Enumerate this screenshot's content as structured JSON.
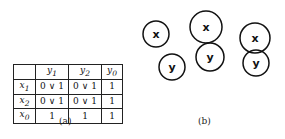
{
  "panel_a": {
    "caption": "(a)",
    "table": {
      "header": [
        "",
        "y1",
        "y2",
        "y0"
      ],
      "rows": [
        {
          "label": "x1",
          "cells": [
            "0 ∨ 1",
            "0 ∨ 1",
            "1"
          ]
        },
        {
          "label": "x2",
          "cells": [
            "0 ∨ 1",
            "0 ∨ 1",
            "1"
          ]
        },
        {
          "label": "x0",
          "cells": [
            "1",
            "1",
            "1"
          ]
        }
      ]
    }
  },
  "panel_b": {
    "caption": "(b)",
    "nodes": [
      {
        "label": "x",
        "cx": 156,
        "cy": 34,
        "r": 13
      },
      {
        "label": "y",
        "cx": 172,
        "cy": 67,
        "r": 13
      },
      {
        "label": "x",
        "cx": 206,
        "cy": 27,
        "r": 16
      },
      {
        "label": "y",
        "cx": 210,
        "cy": 57,
        "r": 14
      },
      {
        "label": "x",
        "cx": 255,
        "cy": 38,
        "r": 15
      },
      {
        "label": "y",
        "cx": 256,
        "cy": 63,
        "r": 13
      }
    ],
    "stroke_color": "#111111"
  }
}
